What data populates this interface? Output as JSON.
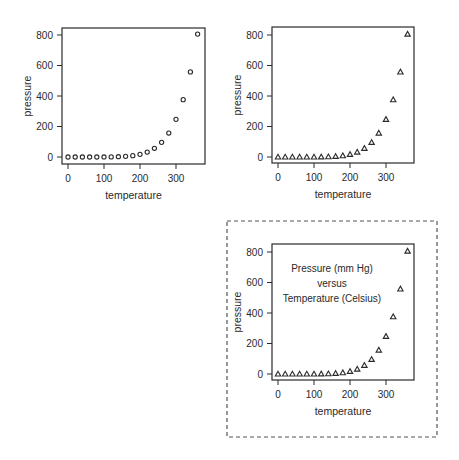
{
  "chart_data": [
    {
      "type": "scatter",
      "panel": "top-left",
      "title": "",
      "xlabel": "temperature",
      "ylabel": "pressure",
      "marker": "circle",
      "x": [
        0,
        20,
        40,
        60,
        80,
        100,
        120,
        140,
        160,
        180,
        200,
        220,
        240,
        260,
        280,
        300,
        320,
        340,
        360
      ],
      "y": [
        0.0002,
        0.0012,
        0.006,
        0.03,
        0.09,
        0.27,
        0.75,
        1.85,
        4.2,
        8.8,
        17.3,
        32.1,
        57,
        96,
        157,
        247,
        376,
        558,
        806
      ],
      "xticks": [
        0,
        100,
        200,
        300
      ],
      "yticks": [
        0,
        200,
        400,
        600,
        800
      ],
      "xlim": [
        -10,
        370
      ],
      "ylim": [
        -20,
        820
      ],
      "grid": false,
      "annotations": []
    },
    {
      "type": "scatter",
      "panel": "top-right",
      "title": "",
      "xlabel": "temperature",
      "ylabel": "pressure",
      "marker": "triangle",
      "x": [
        0,
        20,
        40,
        60,
        80,
        100,
        120,
        140,
        160,
        180,
        200,
        220,
        240,
        260,
        280,
        300,
        320,
        340,
        360
      ],
      "y": [
        0.0002,
        0.0012,
        0.006,
        0.03,
        0.09,
        0.27,
        0.75,
        1.85,
        4.2,
        8.8,
        17.3,
        32.1,
        57,
        96,
        157,
        247,
        376,
        558,
        806
      ],
      "xticks": [
        0,
        100,
        200,
        300
      ],
      "yticks": [
        0,
        200,
        400,
        600,
        800
      ],
      "xlim": [
        -10,
        370
      ],
      "ylim": [
        -20,
        820
      ],
      "grid": false,
      "annotations": []
    },
    {
      "type": "scatter",
      "panel": "bottom-right",
      "title": "",
      "xlabel": "temperature",
      "ylabel": "pressure",
      "marker": "triangle",
      "x": [
        0,
        20,
        40,
        60,
        80,
        100,
        120,
        140,
        160,
        180,
        200,
        220,
        240,
        260,
        280,
        300,
        320,
        340,
        360
      ],
      "y": [
        0.0002,
        0.0012,
        0.006,
        0.03,
        0.09,
        0.27,
        0.75,
        1.85,
        4.2,
        8.8,
        17.3,
        32.1,
        57,
        96,
        157,
        247,
        376,
        558,
        806
      ],
      "xticks": [
        0,
        100,
        200,
        300
      ],
      "yticks": [
        0,
        200,
        400,
        600,
        800
      ],
      "xlim": [
        -10,
        370
      ],
      "ylim": [
        -20,
        820
      ],
      "grid": false,
      "annotations": [
        "Pressure (mm Hg)",
        "versus",
        "Temperature (Celsius)"
      ],
      "framed": "dashed"
    }
  ],
  "panels": [
    {
      "id": "plot-top-left",
      "box": {
        "left": 62,
        "top": 28,
        "right": 205,
        "bottom": 164
      },
      "x_map": {
        "v0": 0,
        "p0": 68,
        "v1": 300,
        "p1": 176
      },
      "y_map": {
        "v0": 0,
        "p0": 157,
        "v1": 800,
        "p1": 35
      },
      "annotation_center": null
    },
    {
      "id": "plot-top-right",
      "box": {
        "left": 272,
        "top": 27,
        "right": 414,
        "bottom": 163
      },
      "x_map": {
        "v0": 0,
        "p0": 278,
        "v1": 300,
        "p1": 386
      },
      "y_map": {
        "v0": 0,
        "p0": 157,
        "v1": 800,
        "p1": 35
      },
      "annotation_center": null
    },
    {
      "id": "plot-bottom-right",
      "box": {
        "left": 272,
        "top": 244,
        "right": 414,
        "bottom": 380
      },
      "x_map": {
        "v0": 0,
        "p0": 278,
        "v1": 300,
        "p1": 386
      },
      "y_map": {
        "v0": 0,
        "p0": 374,
        "v1": 800,
        "p1": 252
      },
      "annotation_center": {
        "x": 332,
        "y": 268,
        "line_height": 15
      }
    }
  ],
  "dashed_frame": {
    "left": 227,
    "top": 221,
    "right": 437,
    "bottom": 437
  },
  "colors": {
    "ink": "#2a2a2a",
    "background": "#ffffff",
    "frame": "#555555"
  }
}
